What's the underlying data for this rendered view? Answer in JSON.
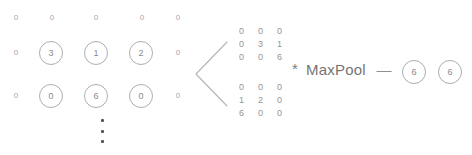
{
  "diagram": {
    "input_grid": {
      "rows": [
        [
          {
            "value": "0",
            "circled": false
          },
          {
            "value": "0",
            "circled": false
          },
          {
            "value": "0",
            "circled": false
          },
          {
            "value": "0",
            "circled": false
          },
          {
            "value": "0",
            "circled": false
          }
        ],
        [
          {
            "value": "0",
            "circled": false
          },
          {
            "value": "3",
            "circled": true
          },
          {
            "value": "1",
            "circled": true
          },
          {
            "value": "2",
            "circled": true
          },
          {
            "value": "0",
            "circled": false
          }
        ],
        [
          {
            "value": "0",
            "circled": false
          },
          {
            "value": "0",
            "circled": true
          },
          {
            "value": "6",
            "circled": true
          },
          {
            "value": "0",
            "circled": true
          },
          {
            "value": "0",
            "circled": false
          }
        ]
      ],
      "continuation": "vertical-ellipsis"
    },
    "bracket": "angle-bracket-left",
    "patch_matrices": [
      {
        "name": "channel-0-patch",
        "rows": [
          [
            "0",
            "0",
            "0"
          ],
          [
            "0",
            "3",
            "1"
          ],
          [
            "0",
            "0",
            "6"
          ]
        ]
      },
      {
        "name": "channel-1-patch",
        "rows": [
          [
            "0",
            "0",
            "0"
          ],
          [
            "1",
            "2",
            "0"
          ],
          [
            "6",
            "0",
            "0"
          ]
        ]
      }
    ],
    "operation": {
      "asterisk": "*",
      "label": "MaxPool",
      "dash": "—"
    },
    "output_cells": [
      "6",
      "6"
    ],
    "colors": {
      "text": "#8c8c8c",
      "circle_stroke": "#adadad",
      "bracket_stroke": "#b5b5b5",
      "label": "#757575",
      "dot": "#555555"
    }
  }
}
